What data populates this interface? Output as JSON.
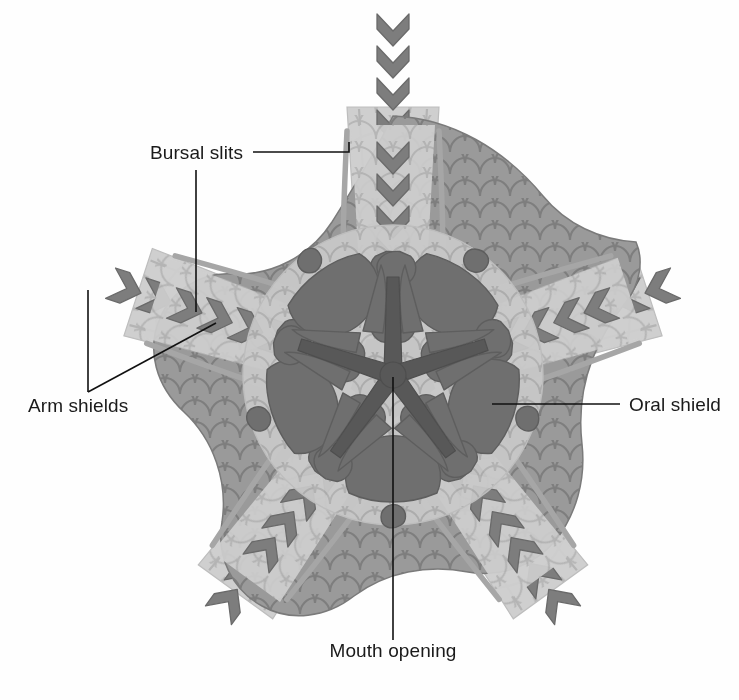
{
  "figure": {
    "background_color": "#fefefe"
  },
  "labels": {
    "bursal_slits": "Bursal slits",
    "arm_shields": "Arm shields",
    "oral_shield": "Oral shield",
    "mouth_opening": "Mouth opening"
  },
  "palette": {
    "disc_outer": "#9a9a9a",
    "disc_outer_stroke": "#7d7d7d",
    "disc_inner": "#c9c9c9",
    "plate_dark": "#6f6f6f",
    "plate_dark_stroke": "#5e5e5e",
    "mouth_star": "#585858",
    "arm_fill": "#cfcfcf",
    "arm_stroke": "#b4b4b4",
    "arm_shield": "#7d7d7d",
    "arm_shield_stroke": "#6a6a6a",
    "bursal_line": "#9e9e9e",
    "leader_line": "#111111",
    "text": "#1a1a1a"
  },
  "anatomy": {
    "symmetry": "pentaradial",
    "arm_count": 5,
    "arm_angles_deg": [
      90,
      18,
      306,
      234,
      162
    ],
    "disc_center": [
      393,
      375
    ],
    "mouth_star_rays": 5,
    "arm_shield_chevrons_per_arm": 8
  },
  "callouts": [
    {
      "name": "bursal-slits",
      "text": "Bursal slits",
      "text_anchor": "end",
      "text_xy": [
        243,
        159
      ],
      "leaders": [
        [
          [
            253,
            152
          ],
          [
            349,
            152
          ],
          [
            349,
            140
          ]
        ],
        [
          [
            196,
            170
          ],
          [
            196,
            312
          ]
        ]
      ]
    },
    {
      "name": "arm-shields",
      "text": "Arm shields",
      "text_anchor": "start",
      "text_xy": [
        28,
        412
      ],
      "leaders": [
        [
          [
            88,
            392
          ],
          [
            88,
            290
          ]
        ],
        [
          [
            88,
            392
          ],
          [
            216,
            323
          ]
        ]
      ]
    },
    {
      "name": "oral-shield",
      "text": "Oral shield",
      "text_anchor": "start",
      "text_xy": [
        629,
        411
      ],
      "leaders": [
        [
          [
            620,
            404
          ],
          [
            492,
            404
          ]
        ]
      ]
    },
    {
      "name": "mouth-opening",
      "text": "Mouth opening",
      "text_anchor": "middle",
      "text_xy": [
        393,
        657
      ],
      "leaders": [
        [
          [
            393,
            640
          ],
          [
            393,
            377
          ]
        ]
      ]
    }
  ]
}
